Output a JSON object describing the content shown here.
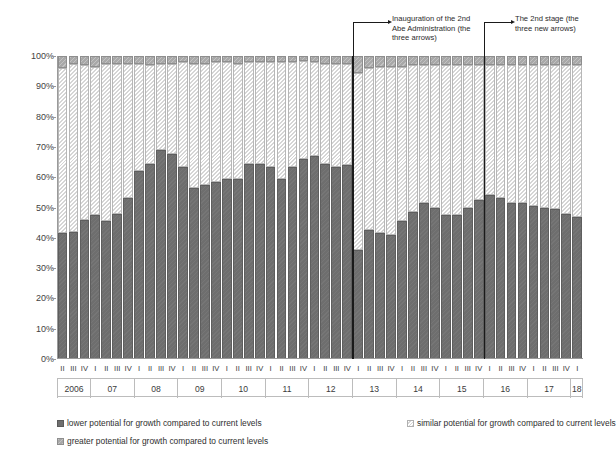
{
  "chart_data": {
    "type": "bar",
    "subtype": "stacked-100-percent",
    "title": "",
    "xlabel": "",
    "ylabel": "",
    "ylim": [
      0,
      100
    ],
    "ytick_labels": [
      "0%",
      "10%",
      "20%",
      "30%",
      "40%",
      "50%",
      "60%",
      "70%",
      "80%",
      "90%",
      "100%"
    ],
    "ytick_values": [
      0,
      10,
      20,
      30,
      40,
      50,
      60,
      70,
      80,
      90,
      100
    ],
    "grid": false,
    "legend_position": "bottom",
    "categories": [
      "2006-II",
      "2006-III",
      "2006-IV",
      "2007-I",
      "2007-II",
      "2007-III",
      "2007-IV",
      "2008-I",
      "2008-II",
      "2008-III",
      "2008-IV",
      "2009-I",
      "2009-II",
      "2009-III",
      "2009-IV",
      "2010-I",
      "2010-II",
      "2010-III",
      "2010-IV",
      "2011-I",
      "2011-II",
      "2011-III",
      "2011-IV",
      "2012-I",
      "2012-II",
      "2012-III",
      "2012-IV",
      "2013-I",
      "2013-II",
      "2013-III",
      "2013-IV",
      "2014-I",
      "2014-II",
      "2014-III",
      "2014-IV",
      "2015-I",
      "2015-II",
      "2015-III",
      "2015-IV",
      "2016-I",
      "2016-II",
      "2016-III",
      "2016-IV",
      "2017-I",
      "2017-II",
      "2017-III",
      "2017-IV",
      "2018-I"
    ],
    "quarter_labels": [
      "II",
      "III",
      "IV",
      "I",
      "II",
      "III",
      "IV",
      "I",
      "II",
      "III",
      "IV",
      "I",
      "II",
      "III",
      "IV",
      "I",
      "II",
      "III",
      "IV",
      "I",
      "II",
      "III",
      "IV",
      "I",
      "II",
      "III",
      "IV",
      "I",
      "II",
      "III",
      "IV",
      "I",
      "II",
      "III",
      "IV",
      "I",
      "II",
      "III",
      "IV",
      "I",
      "II",
      "III",
      "IV",
      "I",
      "II",
      "III",
      "IV",
      "I"
    ],
    "year_groups": [
      {
        "label": "2006",
        "count": 3
      },
      {
        "label": "07",
        "count": 4
      },
      {
        "label": "08",
        "count": 4
      },
      {
        "label": "09",
        "count": 4
      },
      {
        "label": "10",
        "count": 4
      },
      {
        "label": "11",
        "count": 4
      },
      {
        "label": "12",
        "count": 4
      },
      {
        "label": "13",
        "count": 4
      },
      {
        "label": "14",
        "count": 4
      },
      {
        "label": "15",
        "count": 4
      },
      {
        "label": "16",
        "count": 4
      },
      {
        "label": "17",
        "count": 4
      },
      {
        "label": "18",
        "count": 1
      }
    ],
    "series": [
      {
        "name": "lower potential for growth compared to current levels",
        "key": "lower",
        "color": "#6e6e6e",
        "values": [
          41.5,
          42.0,
          46.0,
          47.5,
          45.5,
          48.0,
          53.0,
          62.0,
          64.5,
          69.0,
          67.5,
          63.5,
          56.5,
          57.5,
          58.5,
          59.5,
          59.5,
          64.5,
          64.5,
          63.5,
          59.5,
          63.5,
          66.0,
          67.0,
          64.5,
          63.5,
          64.0,
          36.0,
          42.5,
          41.5,
          41.0,
          45.5,
          48.5,
          51.5,
          50.0,
          47.5,
          47.5,
          50.0,
          52.5,
          54.0,
          53.0,
          51.5,
          51.5,
          50.5,
          50.0,
          49.5,
          48.0,
          47.0
        ]
      },
      {
        "name": "similar potential for growth compared to current levels",
        "key": "similar",
        "color": "#ededed",
        "values": [
          54.5,
          55.5,
          51.0,
          49.0,
          52.0,
          49.5,
          44.5,
          35.5,
          32.5,
          28.5,
          30.0,
          34.5,
          41.0,
          40.0,
          39.5,
          38.5,
          38.0,
          33.5,
          33.5,
          34.5,
          38.5,
          34.5,
          32.5,
          31.0,
          33.0,
          34.0,
          33.5,
          58.5,
          53.5,
          55.0,
          55.5,
          51.0,
          48.5,
          45.5,
          47.0,
          49.5,
          49.5,
          47.0,
          44.5,
          43.0,
          44.0,
          45.5,
          45.5,
          46.5,
          47.0,
          47.5,
          49.0,
          50.0
        ]
      },
      {
        "name": "greater potential for growth compared to current levels",
        "key": "greater",
        "color": "#a8a8a8",
        "values": [
          4.0,
          2.5,
          3.0,
          3.5,
          2.5,
          2.5,
          2.5,
          2.5,
          3.0,
          2.5,
          2.5,
          2.0,
          2.5,
          2.5,
          2.0,
          2.0,
          2.5,
          2.0,
          2.0,
          2.0,
          2.0,
          2.0,
          1.5,
          2.0,
          2.5,
          2.5,
          2.5,
          5.5,
          4.0,
          3.5,
          3.5,
          3.5,
          3.0,
          3.0,
          3.0,
          3.0,
          3.0,
          3.0,
          3.0,
          3.0,
          3.0,
          3.0,
          3.0,
          3.0,
          3.0,
          3.0,
          3.0,
          3.0
        ]
      }
    ],
    "annotations": [
      {
        "text": "Inauguration of the 2nd\nAbe Administration (the\nthree arrows)",
        "at_category": "2013-I"
      },
      {
        "text": "The 2nd stage (the\nthree new arrows)",
        "at_category": "2016-I"
      }
    ]
  },
  "legend": {
    "items": [
      {
        "label": "lower potential for growth compared to current levels",
        "swatch": "dark"
      },
      {
        "label": "similar potential for growth compared to current levels",
        "swatch": "light"
      },
      {
        "label": "greater potential for growth compared to current levels",
        "swatch": "mid"
      }
    ]
  }
}
